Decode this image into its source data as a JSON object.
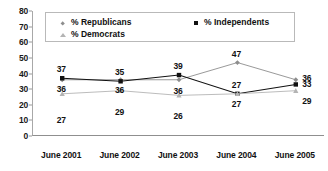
{
  "chart_data": {
    "type": "line",
    "title": "",
    "xlabel": "",
    "ylabel": "",
    "categories": [
      "June 2001",
      "June 2002",
      "June 2003",
      "June 2004",
      "June 2005"
    ],
    "ylim": [
      0,
      80
    ],
    "yticks": [
      80,
      70,
      60,
      50,
      40,
      30,
      20,
      10,
      0
    ],
    "grid": false,
    "legend_position": "top-inside",
    "series": [
      {
        "name": "% Republicans",
        "marker": "diamond",
        "color": "#8d8d8d",
        "values": [
          36,
          36,
          36,
          47,
          36
        ]
      },
      {
        "name": "% Independents",
        "marker": "square",
        "color": "#111111",
        "values": [
          37,
          35,
          39,
          27,
          33
        ]
      },
      {
        "name": "% Democrats",
        "marker": "triangle",
        "color": "#b4b4b4",
        "values": [
          27,
          29,
          26,
          27,
          29
        ]
      }
    ],
    "point_labels": [
      {
        "text": "37",
        "category": "June 2001",
        "series": "% Independents",
        "value": 37
      },
      {
        "text": "36",
        "category": "June 2001",
        "series": "% Republicans",
        "value": 36
      },
      {
        "text": "27",
        "category": "June 2001",
        "series": "% Democrats",
        "value": 27
      },
      {
        "text": "35",
        "category": "June 2002",
        "series": "% Independents",
        "value": 35
      },
      {
        "text": "36",
        "category": "June 2002",
        "series": "% Republicans",
        "value": 36
      },
      {
        "text": "29",
        "category": "June 2002",
        "series": "% Democrats",
        "value": 29
      },
      {
        "text": "39",
        "category": "June 2003",
        "series": "% Independents",
        "value": 39
      },
      {
        "text": "36",
        "category": "June 2003",
        "series": "% Republicans",
        "value": 36
      },
      {
        "text": "26",
        "category": "June 2003",
        "series": "% Democrats",
        "value": 26
      },
      {
        "text": "47",
        "category": "June 2004",
        "series": "% Republicans",
        "value": 47
      },
      {
        "text": "27",
        "category": "June 2004",
        "series": "% Democrats",
        "value": 27
      },
      {
        "text": "27",
        "category": "June 2004",
        "series": "% Independents",
        "value": 27
      },
      {
        "text": "36",
        "category": "June 2005",
        "series": "% Republicans",
        "value": 36
      },
      {
        "text": "33",
        "category": "June 2005",
        "series": "% Independents",
        "value": 33
      },
      {
        "text": "29",
        "category": "June 2005",
        "series": "% Democrats",
        "value": 29
      }
    ]
  },
  "axis": {
    "y_labels": [
      "80",
      "70",
      "60",
      "50",
      "40",
      "30",
      "20",
      "10",
      "0"
    ],
    "x_labels": [
      "June 2001",
      "June 2002",
      "June 2003",
      "June 2004",
      "June 2005"
    ]
  },
  "legend": {
    "republicans": "% Republicans",
    "independents": "% Independents",
    "democrats": "% Democrats"
  }
}
